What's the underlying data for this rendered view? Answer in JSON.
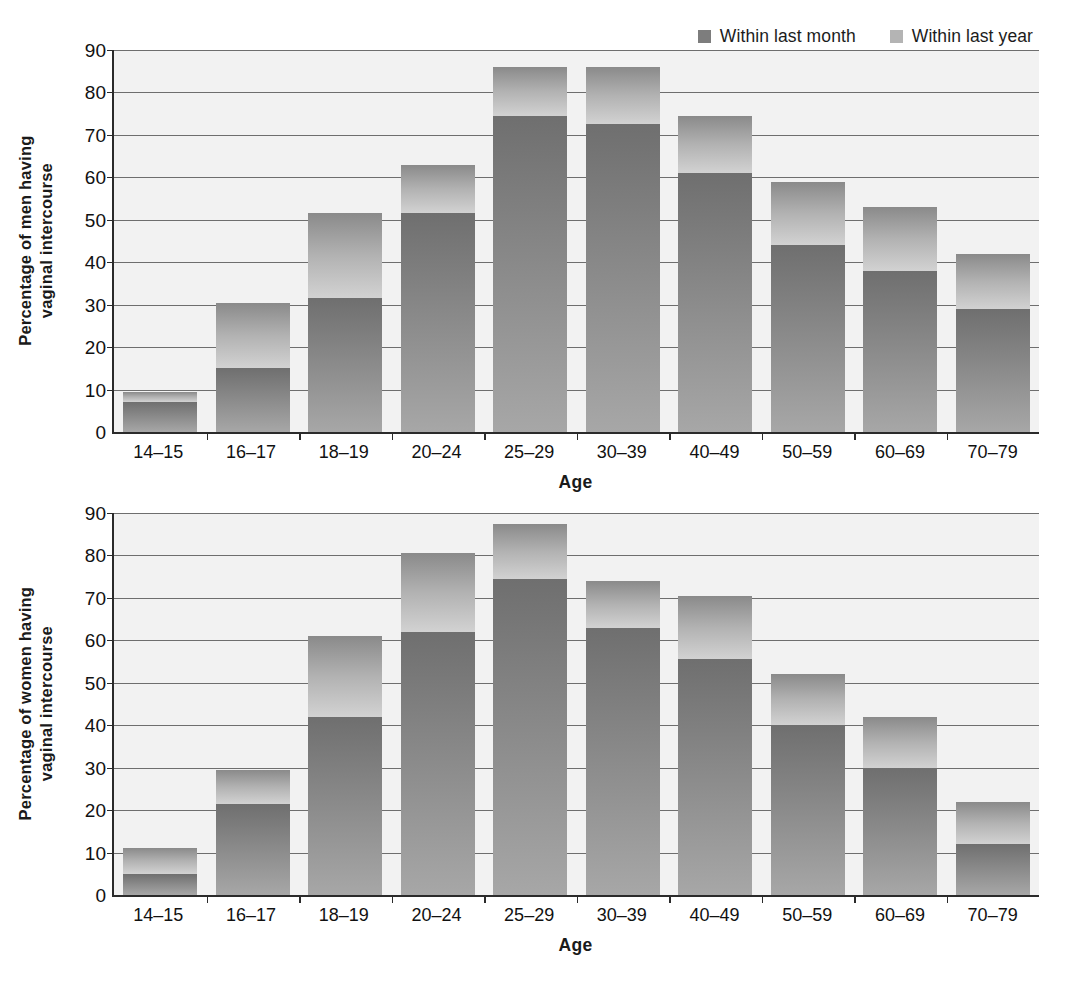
{
  "legend": {
    "items": [
      {
        "label": "Within last month",
        "swatch_color": "#7d7d7d",
        "key": "month"
      },
      {
        "label": "Within last year",
        "swatch_color": "#b4b4b4",
        "key": "year"
      }
    ]
  },
  "charts": [
    {
      "id": "men",
      "ylabel_line1": "Percentage of men having",
      "ylabel_line2": "vaginal intercourse",
      "xlabel": "Age"
    },
    {
      "id": "women",
      "ylabel_line1": "Percentage of women having",
      "ylabel_line2": "vaginal intercourse",
      "xlabel": "Age"
    }
  ],
  "axis": {
    "yticks": [
      "0",
      "10",
      "20",
      "30",
      "40",
      "50",
      "60",
      "70",
      "80",
      "90"
    ],
    "ymin": 0,
    "ymax": 90
  },
  "chart_data": [
    {
      "type": "bar",
      "stacked": true,
      "title": "",
      "xlabel": "Age",
      "ylabel": "Percentage of men having vaginal intercourse",
      "ylim": [
        0,
        90
      ],
      "ytick_step": 10,
      "grid": true,
      "legend_position": "top-right",
      "categories": [
        "14–15",
        "16–17",
        "18–19",
        "20–24",
        "25–29",
        "30–39",
        "40–49",
        "50–59",
        "60–69",
        "70–79"
      ],
      "series": [
        {
          "name": "Within last month",
          "values": [
            7,
            15,
            31.5,
            51.5,
            74.5,
            72.5,
            61,
            44,
            38,
            29
          ]
        },
        {
          "name": "Within last year",
          "values": [
            2.5,
            15.5,
            20,
            11.5,
            11.5,
            13.5,
            13.5,
            15,
            15,
            13
          ]
        }
      ],
      "totals": [
        9.5,
        30.5,
        51.5,
        63,
        86,
        86,
        74.5,
        59,
        53,
        42
      ]
    },
    {
      "type": "bar",
      "stacked": true,
      "title": "",
      "xlabel": "Age",
      "ylabel": "Percentage of women having vaginal intercourse",
      "ylim": [
        0,
        90
      ],
      "ytick_step": 10,
      "grid": true,
      "legend_position": "top-right",
      "categories": [
        "14–15",
        "16–17",
        "18–19",
        "20–24",
        "25–29",
        "30–39",
        "40–49",
        "50–59",
        "60–69",
        "70–79"
      ],
      "series": [
        {
          "name": "Within last month",
          "values": [
            5,
            21.5,
            42,
            62,
            74.5,
            63,
            55.5,
            40,
            30,
            12
          ]
        },
        {
          "name": "Within last year",
          "values": [
            6,
            8,
            19,
            18.5,
            13,
            11,
            15,
            12,
            12,
            10
          ]
        }
      ],
      "totals": [
        11,
        29.5,
        61,
        80.5,
        87.5,
        74,
        70.5,
        52,
        42,
        22
      ]
    }
  ]
}
